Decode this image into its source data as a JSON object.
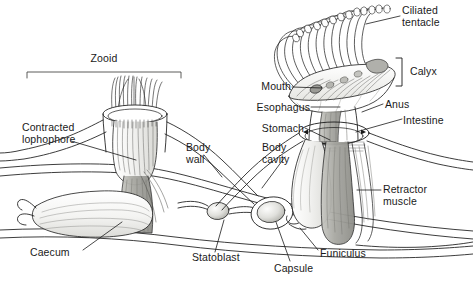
{
  "figure": {
    "background_color": "#ffffff",
    "line_color": "#1a1a1a",
    "text_color": "#1a1a1a",
    "width": 473,
    "height": 282
  },
  "brackets": [
    {
      "name": "zooid-bracket",
      "label": "Zooid",
      "x1": 27,
      "x2": 181,
      "y": 72,
      "label_x": 104,
      "label_y": 55
    },
    {
      "name": "calyx-bracket",
      "label": "Calyx",
      "x": 401,
      "y1": 58,
      "y2": 86,
      "label_x": 409,
      "label_y": 66
    }
  ],
  "labels": [
    {
      "id": "ciliated-tentacle",
      "text": "Ciliated\ntentacle",
      "x": 402,
      "y": 5,
      "align": "left"
    },
    {
      "id": "calyx",
      "text": "Calyx",
      "x": 410,
      "y": 66,
      "align": "left"
    },
    {
      "id": "mouth",
      "text": "Mouth",
      "x": 291,
      "y": 81,
      "align": "right"
    },
    {
      "id": "anus",
      "text": "Anus",
      "x": 385,
      "y": 99,
      "align": "left"
    },
    {
      "id": "esophagus",
      "text": "Esophagus",
      "x": 310,
      "y": 102,
      "align": "right"
    },
    {
      "id": "intestine",
      "text": "Intestine",
      "x": 403,
      "y": 115,
      "align": "left"
    },
    {
      "id": "stomach",
      "text": "Stomach",
      "x": 304,
      "y": 123,
      "align": "right"
    },
    {
      "id": "contracted-lophophore",
      "text": "Contracted\nlophophore",
      "x": 22,
      "y": 122,
      "align": "left"
    },
    {
      "id": "body-wall",
      "text": "Body\nwall",
      "x": 186,
      "y": 142,
      "align": "left"
    },
    {
      "id": "body-cavity",
      "text": "Body\ncavity",
      "x": 262,
      "y": 142,
      "align": "left"
    },
    {
      "id": "retractor-muscle",
      "text": "Retractor\nmuscle",
      "x": 383,
      "y": 184,
      "align": "left"
    },
    {
      "id": "caecum",
      "text": "Caecum",
      "x": 30,
      "y": 247,
      "align": "left"
    },
    {
      "id": "statoblast",
      "text": "Statoblast",
      "x": 192,
      "y": 252,
      "align": "left"
    },
    {
      "id": "capsule",
      "text": "Capsule",
      "x": 274,
      "y": 263,
      "align": "left"
    },
    {
      "id": "funiculus",
      "text": "Funiculus",
      "x": 320,
      "y": 248,
      "align": "left"
    }
  ],
  "structures": [
    {
      "id": "left-zooid",
      "name": "contracted zooid with retracted lophophore"
    },
    {
      "id": "right-zooid",
      "name": "expanded zooid with everted lophophore"
    },
    {
      "id": "stolon",
      "name": "colonial body wall / stolon"
    },
    {
      "id": "statoblast-small",
      "name": "developing statoblast"
    },
    {
      "id": "statoblast-large",
      "name": "mature statoblast with capsule"
    }
  ]
}
